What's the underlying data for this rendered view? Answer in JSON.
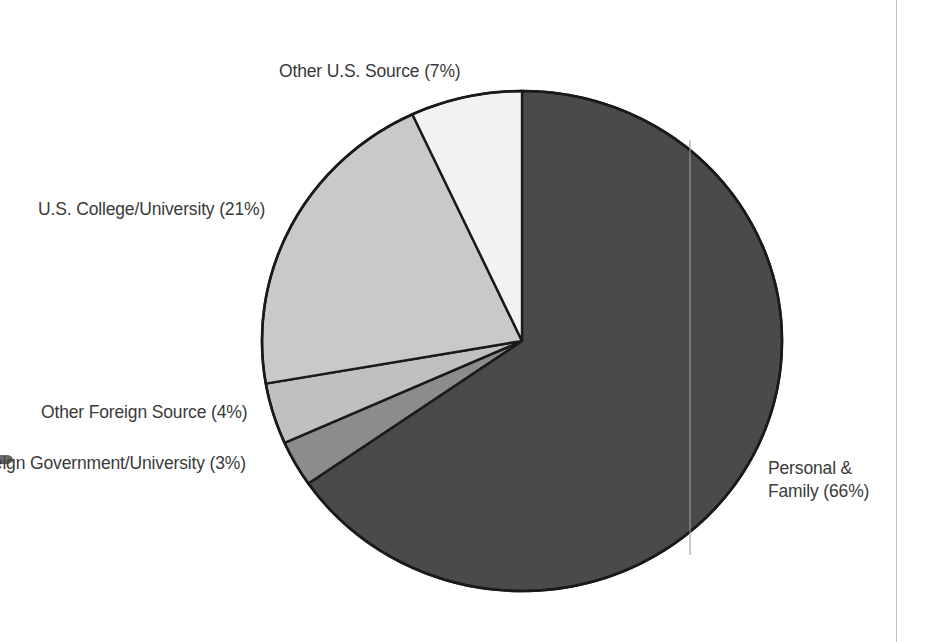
{
  "chart_data": {
    "type": "pie",
    "title": "",
    "subtitle": "",
    "xlabel": "",
    "ylabel": "",
    "legend_position": "outside-labels",
    "grid": false,
    "start_angle_deg": 0,
    "direction": "clockwise",
    "categories": [
      "Personal & Family",
      "Foreign Government/University",
      "Other Foreign Source",
      "U.S. College/University",
      "Other U.S. Source"
    ],
    "values": [
      66,
      3,
      4,
      21,
      7
    ],
    "unit": "%",
    "slices": [
      {
        "name": "Personal & Family",
        "value": 66,
        "label": "Personal &\nFamily (66%)",
        "label_line1": "Personal &",
        "label_line2": "Family (66%)",
        "color": "#4a4a4a",
        "start_deg": 0,
        "end_deg": 237.6
      },
      {
        "name": "Foreign Government/University",
        "value": 3,
        "label": "Foreign Government/University (3%)",
        "label_clipped": "reign Government/University (3%)",
        "color": "#8c8c8c",
        "start_deg": 237.6,
        "end_deg": 248.4
      },
      {
        "name": "Other Foreign Source",
        "value": 4,
        "label": "Other Foreign Source (4%)",
        "color": "#c0c0c0",
        "start_deg": 248.4,
        "end_deg": 262.8
      },
      {
        "name": "U.S. College/University",
        "value": 21,
        "label": "U.S. College/University (21%)",
        "color": "#c9c9c9",
        "start_deg": 262.8,
        "end_deg": 338.4
      },
      {
        "name": "Other U.S. Source",
        "value": 7,
        "label": "Other U.S. Source (7%)",
        "color": "#f2f2f2",
        "start_deg": 338.4,
        "end_deg": 360
      }
    ]
  },
  "labels": {
    "other_us_source": "Other U.S. Source (7%)",
    "us_college_university": "U.S. College/University (21%)",
    "other_foreign_source": "Other Foreign Source (4%)",
    "foreign_government_university": "Foreign Government/University (3%)",
    "personal_family_line1": "Personal &",
    "personal_family_line2": "Family (66%)"
  },
  "colors": {
    "background": "#ffffff",
    "outline": "#1a1a1a",
    "text": "#3a3a3a",
    "personal_family": "#4a4a4a",
    "foreign_government_university": "#8c8c8c",
    "other_foreign_source": "#c0c0c0",
    "us_college_university": "#c9c9c9",
    "other_us_source": "#f2f2f2",
    "margin_rule": "#b9b9b9"
  }
}
